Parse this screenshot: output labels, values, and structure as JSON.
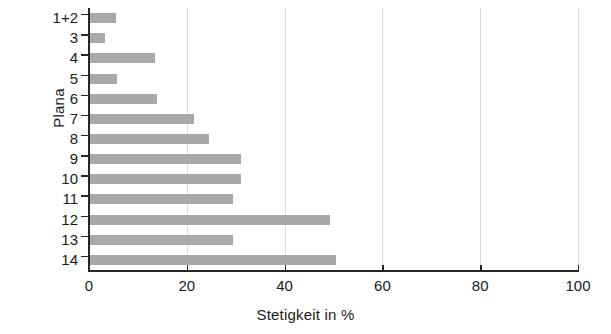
{
  "chart_data": {
    "type": "bar",
    "orientation": "horizontal",
    "title": "",
    "xlabel": "Stetigkeit in %",
    "ylabel": "Plana",
    "categories": [
      "1+2",
      "3",
      "4",
      "5",
      "6",
      "7",
      "8",
      "9",
      "10",
      "11",
      "12",
      "13",
      "14"
    ],
    "values": [
      5.5,
      3.3,
      13.5,
      5.7,
      14.0,
      21.5,
      24.5,
      31.0,
      31.0,
      29.5,
      49.3,
      29.5,
      50.5
    ],
    "xlim": [
      0,
      100
    ],
    "xticks": [
      0,
      20,
      40,
      60,
      80,
      100
    ],
    "xtick_labels": [
      "0",
      "20",
      "40",
      "60",
      "80",
      "100"
    ],
    "grid": "vertical-only",
    "legend": "none",
    "bar_color": "#a9a9a9",
    "grid_color": "#d9d9d9",
    "axis_color": "#262626"
  }
}
